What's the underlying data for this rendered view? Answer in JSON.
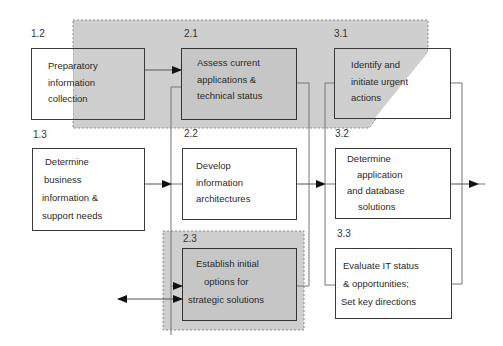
{
  "diagram": {
    "type": "process-flow",
    "colors": {
      "shaded_region": "#cfcfcf",
      "shaded_box": "#c6c6c6",
      "box_border": "#3a3a3a",
      "connector": "#777777",
      "arrow": "#111111"
    },
    "regions": [
      {
        "id": "top-shaded-region",
        "style": "dashed",
        "fill": "#cfcfcf",
        "covers": [
          "1.2 (partial)",
          "2.1",
          "3.1 (partial)"
        ]
      },
      {
        "id": "bottom-shaded-region",
        "style": "dashed",
        "fill": "#cfcfcf",
        "covers": [
          "2.3"
        ]
      }
    ],
    "nodes": [
      {
        "id": "1.2",
        "number": "1.2",
        "lines": [
          "Preparatory",
          "information",
          "collection"
        ]
      },
      {
        "id": "2.1",
        "number": "2.1",
        "lines": [
          "Assess current",
          "applications &",
          "technical status"
        ],
        "shaded": true
      },
      {
        "id": "3.1",
        "number": "3.1",
        "lines": [
          "Identify and",
          "initiate urgent",
          "actions"
        ]
      },
      {
        "id": "1.3",
        "number": "1.3",
        "lines": [
          "Determine",
          "business",
          "information &",
          "support needs"
        ]
      },
      {
        "id": "2.2",
        "number": "2.2",
        "lines": [
          "Develop",
          "information",
          "architectures"
        ]
      },
      {
        "id": "3.2",
        "number": "3.2",
        "lines": [
          "Determine",
          "application",
          "and database",
          "solutions"
        ]
      },
      {
        "id": "2.3",
        "number": "2.3",
        "lines": [
          "Establish initial",
          "options for",
          "strategic solutions"
        ],
        "shaded": true
      },
      {
        "id": "3.3",
        "number": "3.3",
        "lines": [
          "Evaluate IT status",
          "& opportunities;",
          "Set key directions"
        ]
      }
    ],
    "edges": [
      {
        "from": "1.2",
        "to": "2.1",
        "type": "arrow"
      },
      {
        "from": "1.3",
        "to": "2.2 group",
        "type": "arrow"
      },
      {
        "from": "2.2 group",
        "to": "3.2 group",
        "type": "arrow"
      },
      {
        "from": "3.2 group",
        "to": "out-right",
        "type": "arrow"
      },
      {
        "from": "out-left",
        "to": "2.3",
        "type": "double-arrow"
      }
    ]
  }
}
